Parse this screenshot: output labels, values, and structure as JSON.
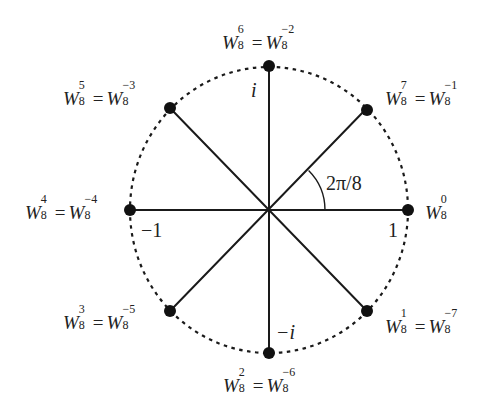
{
  "diagram": {
    "center": {
      "x": 269,
      "y": 210
    },
    "radius_x": 139,
    "radius_y": 143,
    "angle_arc_radius": 56,
    "colors": {
      "line": "#1a1a1a",
      "dot": "#111111",
      "circle": "#1a1a1a",
      "text": "#222222"
    },
    "points": [
      {
        "name": "W8^0",
        "angle_deg": 0,
        "x": 408,
        "y": 210
      },
      {
        "name": "W8^1",
        "angle_deg": -45,
        "x": 367,
        "y": 311
      },
      {
        "name": "W8^2",
        "angle_deg": -90,
        "x": 269,
        "y": 353
      },
      {
        "name": "W8^3",
        "angle_deg": -135,
        "x": 170,
        "y": 311
      },
      {
        "name": "W8^4",
        "angle_deg": 180,
        "x": 130,
        "y": 210
      },
      {
        "name": "W8^5",
        "angle_deg": 135,
        "x": 170,
        "y": 108
      },
      {
        "name": "W8^6",
        "angle_deg": 90,
        "x": 269,
        "y": 66
      },
      {
        "name": "W8^7",
        "angle_deg": 45,
        "x": 367,
        "y": 108
      }
    ],
    "labels": {
      "w0": {
        "base": "W",
        "sub": "8",
        "sup": "0"
      },
      "w1": {
        "base": "W",
        "sub": "8",
        "sup": "1",
        "eq_sup": "−7"
      },
      "w2": {
        "base": "W",
        "sub": "8",
        "sup": "2",
        "eq_sup": "−6"
      },
      "w3": {
        "base": "W",
        "sub": "8",
        "sup": "3",
        "eq_sup": "−5"
      },
      "w4": {
        "base": "W",
        "sub": "8",
        "sup": "4",
        "eq_sup": "−4"
      },
      "w5": {
        "base": "W",
        "sub": "8",
        "sup": "5",
        "eq_sup": "−3"
      },
      "w6": {
        "base": "W",
        "sub": "8",
        "sup": "6",
        "eq_sup": "−2"
      },
      "w7": {
        "base": "W",
        "sub": "8",
        "sup": "7",
        "eq_sup": "−1"
      },
      "equals": "=",
      "axis_i": "i",
      "axis_neg_i": "−i",
      "axis_one": "1",
      "axis_neg_one": "−1",
      "angle": "2π/8"
    }
  }
}
